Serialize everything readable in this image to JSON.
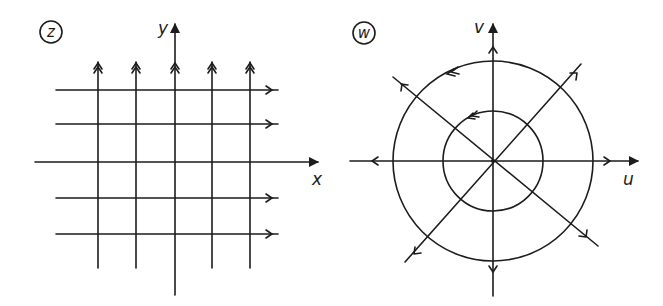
{
  "figure": {
    "stroke_color": "#1c1c1c",
    "background": "#ffffff"
  },
  "left_panel": {
    "plane_label": "z",
    "x_axis_label": "x",
    "y_axis_label": "y",
    "vertical_lines_count": 5,
    "horizontal_lines_count": 4,
    "vertical_line_arrow": "double-chevron-up",
    "horizontal_line_arrow": "single-chevron-right"
  },
  "right_panel": {
    "plane_label": "w",
    "x_axis_label": "u",
    "y_axis_label": "v",
    "circles_count": 2,
    "rays_count": 8,
    "circle_arrow": "double-chevron-counterclockwise",
    "ray_arrow": "single-chevron-outward"
  }
}
